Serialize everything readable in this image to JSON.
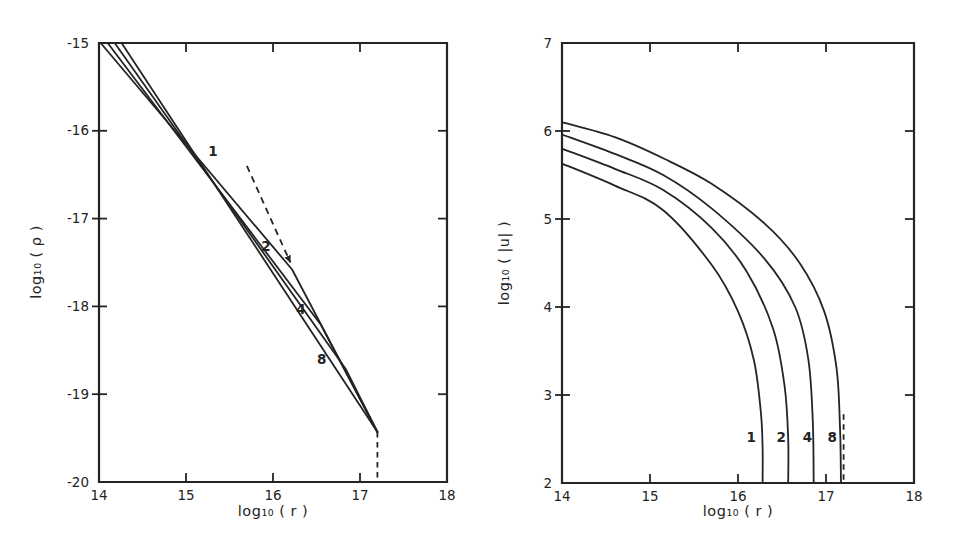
{
  "figure": {
    "ink_color": "#242424",
    "paper_color": "#ffffff"
  },
  "chart_data": [
    {
      "id": "density",
      "type": "line",
      "title": "",
      "xlabel": "log₁₀ ( r )",
      "ylabel": "log₁₀ ( ρ )",
      "xlim": [
        14,
        18
      ],
      "ylim": [
        -20,
        -15
      ],
      "grid": false,
      "legend": "none",
      "xticks": [
        14,
        15,
        16,
        17,
        18
      ],
      "xtick_labels": [
        "14",
        "15",
        "16",
        "17",
        "18"
      ],
      "yticks": [
        -15,
        -16,
        -17,
        -18,
        -19,
        -20
      ],
      "ytick_labels": [
        "-15",
        "-16",
        "-17",
        "-18",
        "-19",
        "-20"
      ],
      "series": [
        {
          "name": "1",
          "label": "1",
          "label_at": [
            15.31,
            -16.24
          ],
          "smooth": false,
          "points": [
            [
              14.02,
              -15.0
            ],
            [
              16.22,
              -17.58
            ],
            [
              17.2,
              -19.43
            ]
          ]
        },
        {
          "name": "2",
          "label": "2",
          "label_at": [
            15.92,
            -17.32
          ],
          "smooth": false,
          "points": [
            [
              14.1,
              -15.0
            ],
            [
              16.55,
              -18.21
            ],
            [
              17.2,
              -19.43
            ]
          ]
        },
        {
          "name": "4",
          "label": "4",
          "label_at": [
            16.32,
            -18.04
          ],
          "smooth": false,
          "points": [
            [
              14.18,
              -15.0
            ],
            [
              16.84,
              -18.72
            ],
            [
              17.2,
              -19.43
            ]
          ]
        },
        {
          "name": "8",
          "label": "8",
          "label_at": [
            16.56,
            -18.6
          ],
          "smooth": false,
          "points": [
            [
              14.26,
              -15.0
            ],
            [
              17.2,
              -19.43
            ]
          ]
        }
      ],
      "dashed_arrow": {
        "from": [
          15.7,
          -16.4
        ],
        "to": [
          16.2,
          -17.5
        ]
      },
      "dashed_drop": {
        "x": 17.2,
        "from_y": -19.43,
        "to_y": -20.0
      }
    },
    {
      "id": "velocity",
      "type": "line",
      "title": "",
      "xlabel": "log₁₀ ( r )",
      "ylabel": "log₁₀ ( |u| )",
      "xlim": [
        14,
        18
      ],
      "ylim": [
        2,
        7
      ],
      "grid": false,
      "legend": "none",
      "xticks": [
        14,
        15,
        16,
        17,
        18
      ],
      "xtick_labels": [
        "14",
        "15",
        "16",
        "17",
        "18"
      ],
      "yticks": [
        7,
        6,
        5,
        4,
        3,
        2
      ],
      "ytick_labels": [
        "7",
        "6",
        "5",
        "4",
        "3",
        "2"
      ],
      "series": [
        {
          "name": "1",
          "label": "1",
          "label_at": [
            16.15,
            2.52
          ],
          "smooth": true,
          "points": [
            [
              14.0,
              5.63
            ],
            [
              14.6,
              5.38
            ],
            [
              15.15,
              5.1
            ],
            [
              15.7,
              4.48
            ],
            [
              16.0,
              3.95
            ],
            [
              16.18,
              3.4
            ],
            [
              16.26,
              2.8
            ],
            [
              16.28,
              2.4
            ],
            [
              16.28,
              2.0
            ]
          ]
        },
        {
          "name": "2",
          "label": "2",
          "label_at": [
            16.49,
            2.52
          ],
          "smooth": true,
          "points": [
            [
              14.0,
              5.8
            ],
            [
              14.6,
              5.57
            ],
            [
              15.15,
              5.33
            ],
            [
              15.7,
              4.9
            ],
            [
              16.1,
              4.4
            ],
            [
              16.4,
              3.75
            ],
            [
              16.53,
              3.1
            ],
            [
              16.57,
              2.5
            ],
            [
              16.57,
              2.0
            ]
          ]
        },
        {
          "name": "4",
          "label": "4",
          "label_at": [
            16.79,
            2.52
          ],
          "smooth": true,
          "points": [
            [
              14.0,
              5.96
            ],
            [
              14.6,
              5.74
            ],
            [
              15.15,
              5.5
            ],
            [
              15.7,
              5.12
            ],
            [
              16.3,
              4.55
            ],
            [
              16.65,
              4.0
            ],
            [
              16.8,
              3.4
            ],
            [
              16.85,
              2.7
            ],
            [
              16.86,
              2.0
            ]
          ]
        },
        {
          "name": "8",
          "label": "8",
          "label_at": [
            17.07,
            2.52
          ],
          "smooth": true,
          "points": [
            [
              14.0,
              6.1
            ],
            [
              14.6,
              5.93
            ],
            [
              15.15,
              5.69
            ],
            [
              15.7,
              5.4
            ],
            [
              16.3,
              4.95
            ],
            [
              16.7,
              4.5
            ],
            [
              16.98,
              3.95
            ],
            [
              17.12,
              3.3
            ],
            [
              17.16,
              2.6
            ],
            [
              17.17,
              2.0
            ]
          ]
        }
      ],
      "dashed_drop": {
        "x": 17.2,
        "from_y": 2.78,
        "to_y": 2.0
      }
    }
  ]
}
